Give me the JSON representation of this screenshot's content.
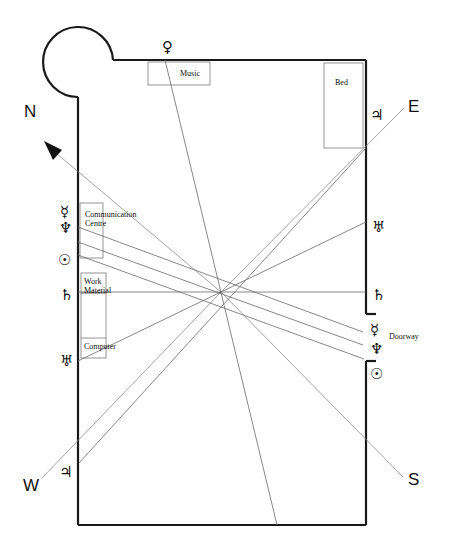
{
  "diagram": {
    "compass": {
      "north": "N",
      "east": "E",
      "south": "S",
      "west": "W"
    },
    "furniture": {
      "music": "Music",
      "bed": "Bed",
      "communication_line1": "Communication",
      "communication_line2": "Centre",
      "work_line1": "Work",
      "work_line2": "Material",
      "computer": "Computer",
      "doorway": "Doorway"
    },
    "planets": {
      "venus_top": "♀",
      "jupiter_right": "♃",
      "uranus_right": "♅",
      "saturn_right": "♄",
      "mercury_right": "☿",
      "neptune_right": "♆",
      "sun_right": "☉",
      "mercury_left": "☿",
      "neptune_left": "♆",
      "sun_left": "☉",
      "saturn_left": "♄",
      "uranus_left": "♅",
      "jupiter_left": "♃"
    },
    "colors": {
      "wall": "#1a1a1a",
      "ray": "#6a6a6a",
      "furniture": "#7a7a7a"
    }
  }
}
